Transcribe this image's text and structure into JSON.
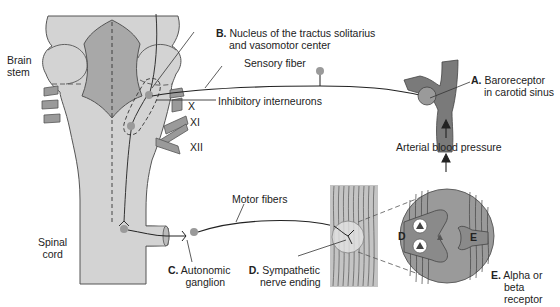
{
  "figure": {
    "colors": {
      "tissue": "#d3d3d3",
      "tissue_dark": "#a8a8a8",
      "outline": "#555555",
      "vessel": "#7a7a7a",
      "neuron_dot": "#9a9a9a",
      "line": "#222222"
    }
  },
  "labels": {
    "brain_stem": [
      "Brain",
      "stem"
    ],
    "spinal_cord": [
      "Spinal",
      "cord"
    ],
    "cranial_nerves": [
      "X",
      "XI",
      "XII"
    ],
    "sensory_fiber": "Sensory fiber",
    "inhibitory_interneurons": "Inhibitory interneurons",
    "motor_fibers": "Motor fibers",
    "arterial_blood_pressure": "Arterial blood pressure",
    "A": {
      "letter": "A.",
      "lines": [
        "Baroreceptor",
        "in carotid sinus"
      ]
    },
    "B": {
      "letter": "B.",
      "lines": [
        "Nucleus of the tractus solitarius",
        "and vasomotor center"
      ]
    },
    "C": {
      "letter": "C.",
      "lines": [
        "Autonomic",
        "ganglion"
      ]
    },
    "D": {
      "letter": "D.",
      "lines": [
        "Sympathetic",
        "nerve ending"
      ]
    },
    "E": {
      "letter": "E.",
      "lines": [
        "Alpha or",
        "beta",
        "receptor"
      ]
    },
    "inset_D": "D",
    "inset_E": "E"
  }
}
